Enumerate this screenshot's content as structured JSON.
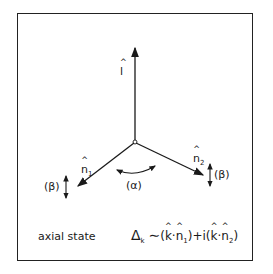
{
  "diagram": {
    "vectors": {
      "l": {
        "symbol": "l",
        "label": "l̂"
      },
      "n1": {
        "symbol": "n",
        "subscript": "1",
        "label": "n̂₁"
      },
      "n2": {
        "symbol": "n",
        "subscript": "2",
        "label": "n̂₂"
      }
    },
    "angle_label": "(α)",
    "beta_left": "(β)",
    "beta_right": "(β)",
    "state_label": "axial state",
    "formula": {
      "lhs": "Δ",
      "lhs_sub": "k",
      "rel": "∼",
      "term1_open": "(",
      "k": "k",
      "dot": "·",
      "n": "n",
      "n1_sub": "1",
      "n2_sub": "2",
      "plus_i": ")+i(",
      "close": ")"
    },
    "colors": {
      "ink": "#1a1a1a",
      "background": "#ffffff"
    }
  }
}
